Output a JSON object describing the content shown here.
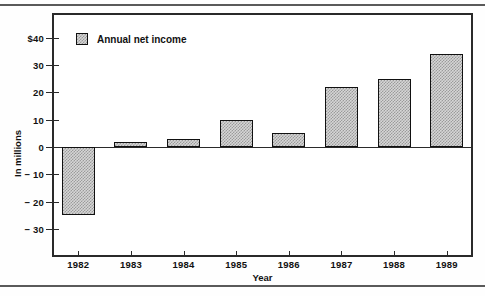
{
  "figure": {
    "y_axis_title": "In millions",
    "x_axis_title": "Year",
    "legend_label": "Annual net income",
    "legend_swatch_name": "hatched-square-swatch"
  },
  "chart_data": {
    "type": "bar",
    "title": "",
    "subtitle": "",
    "xlabel": "Year",
    "ylabel": "In millions",
    "categories": [
      "1982",
      "1983",
      "1984",
      "1985",
      "1986",
      "1987",
      "1988",
      "1989"
    ],
    "values": [
      -25,
      2,
      3,
      10,
      5,
      22,
      25,
      34
    ],
    "series": [
      {
        "name": "Annual net income",
        "values": [
          -25,
          2,
          3,
          10,
          5,
          22,
          25,
          34
        ]
      }
    ],
    "ylim": [
      -35,
      42
    ],
    "ytick_values": [
      40,
      30,
      20,
      10,
      0,
      -10,
      -20,
      -30
    ],
    "ytick_labels": [
      "$40",
      "30",
      "20",
      "10",
      "0",
      "− 10",
      "− 20",
      "− 30"
    ],
    "grid": false,
    "legend_position": "top-left-inside",
    "units": "millions of dollars",
    "baseline": 0,
    "bar_fill": "#d6d6d6",
    "bar_pattern": "checkerboard",
    "bar_border_color": "#111111",
    "axis_color": "#2a2a2a"
  }
}
